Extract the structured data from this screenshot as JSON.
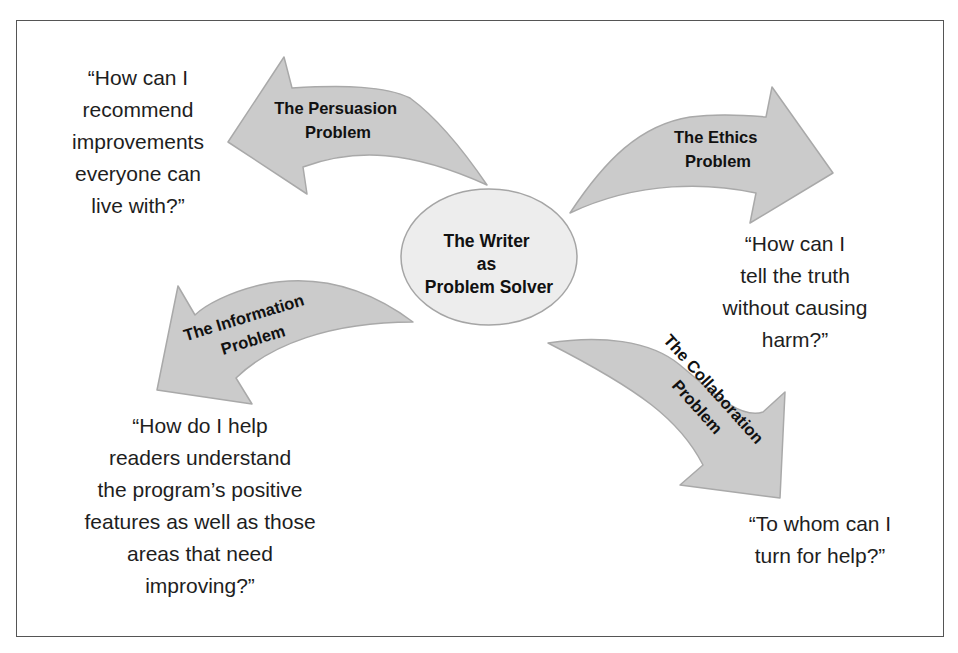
{
  "diagram": {
    "hub": {
      "lines": [
        "The Writer",
        "as",
        "Problem Solver"
      ]
    },
    "branches": [
      {
        "id": "persuasion",
        "direction": "up-left",
        "label_lines": [
          "The Persuasion",
          "Problem"
        ],
        "question": "“How can I\nrecommend\nimprovements\neveryone can\nlive with?”"
      },
      {
        "id": "ethics",
        "direction": "up-right",
        "label_lines": [
          "The Ethics",
          "Problem"
        ],
        "question": "“How can I\ntell the truth\nwithout causing\nharm?”"
      },
      {
        "id": "information",
        "direction": "down-left",
        "label_lines": [
          "The Information",
          "Problem"
        ],
        "question": "“How do I help\nreaders understand\nthe program’s positive\nfeatures as well as those\nareas that need\nimproving?”"
      },
      {
        "id": "collaboration",
        "direction": "down-right",
        "label_lines": [
          "The Collaboration",
          "Problem"
        ],
        "question": "“To whom can I\nturn for help?”"
      }
    ],
    "colors": {
      "arrow_fill": "#cbcbcb",
      "arrow_stroke": "#a9a9a9",
      "hub_fill": "#ededed",
      "hub_stroke": "#a5a5a5",
      "frame_border": "#555555",
      "text": "#1e1e1e"
    }
  }
}
